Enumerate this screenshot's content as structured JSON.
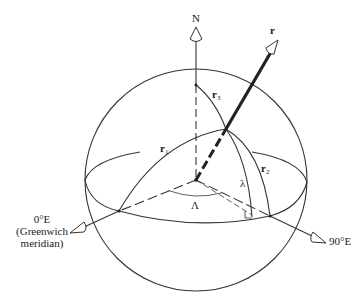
{
  "diagram": {
    "type": "spherical-coordinates",
    "labels": {
      "north": "N",
      "r": "r",
      "r1": "r",
      "r1_sub": "1",
      "r2": "r",
      "r2_sub": "2",
      "r3": "r",
      "r3_sub": "3",
      "lambda": "λ",
      "Lambda": "Λ",
      "east90": "90°E",
      "zero_e_line1": "0°E",
      "zero_e_line2": "(Greenwich",
      "zero_e_line3": "meridian)"
    },
    "colors": {
      "line": "#333333",
      "background": "#ffffff"
    }
  }
}
